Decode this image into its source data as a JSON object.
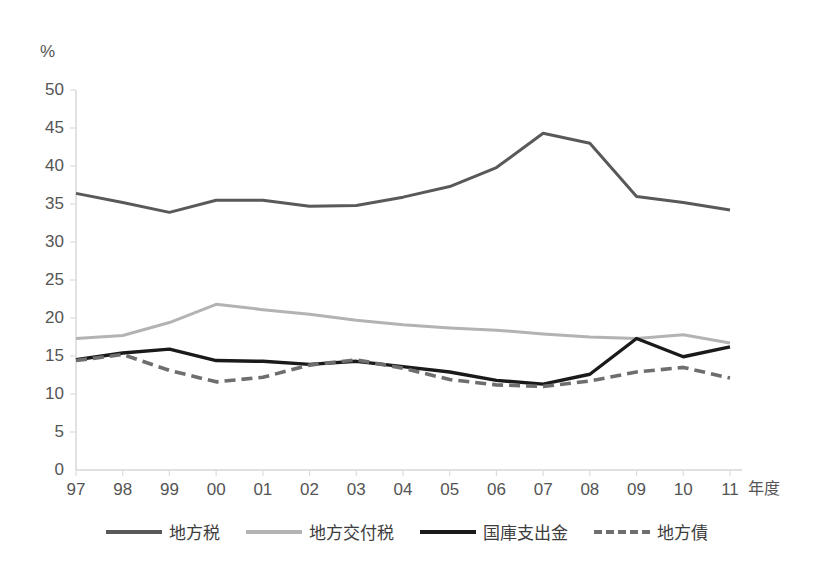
{
  "chart_data": {
    "type": "line",
    "title": "",
    "subtitle": "",
    "xlabel": "年度",
    "ylabel": "%",
    "unit_label": "%",
    "categories": [
      "97",
      "98",
      "99",
      "00",
      "01",
      "02",
      "03",
      "04",
      "05",
      "06",
      "07",
      "08",
      "09",
      "10",
      "11"
    ],
    "xlim": [
      0,
      14
    ],
    "ylim": [
      0,
      50
    ],
    "yticks": [
      0,
      5,
      10,
      15,
      20,
      25,
      30,
      35,
      40,
      45,
      50
    ],
    "ytick_labels": [
      "0",
      "5",
      "10",
      "15",
      "20",
      "25",
      "30",
      "35",
      "40",
      "45",
      "50"
    ],
    "grid": false,
    "legend_position": "bottom",
    "series": [
      {
        "name": "地方税",
        "color": "#595959",
        "style": "solid",
        "width": 3,
        "values": [
          36.4,
          35.2,
          33.9,
          35.5,
          35.5,
          34.7,
          34.8,
          35.9,
          37.3,
          39.8,
          44.3,
          43.0,
          36.0,
          35.2,
          34.2
        ]
      },
      {
        "name": "地方交付税",
        "color": "#b3b3b3",
        "style": "solid",
        "width": 3,
        "values": [
          17.3,
          17.7,
          19.4,
          21.8,
          21.1,
          20.5,
          19.7,
          19.1,
          18.7,
          18.4,
          17.9,
          17.5,
          17.3,
          17.8,
          16.7
        ]
      },
      {
        "name": "国庫支出金",
        "color": "#1a1a1a",
        "style": "solid",
        "width": 3.4,
        "values": [
          14.5,
          15.4,
          15.9,
          14.4,
          14.3,
          13.9,
          14.3,
          13.6,
          12.9,
          11.8,
          11.3,
          12.6,
          17.3,
          14.9,
          16.2
        ]
      },
      {
        "name": "地方債",
        "color": "#6e6e6e",
        "style": "dashed",
        "width": 3.6,
        "values": [
          14.4,
          15.2,
          13.1,
          11.6,
          12.2,
          13.8,
          14.5,
          13.4,
          11.9,
          11.2,
          11.0,
          11.7,
          12.9,
          13.5,
          12.1
        ]
      }
    ]
  },
  "axes": {
    "y_unit": "%",
    "x_title": "年度"
  },
  "legend": {
    "items": [
      {
        "label": "地方税"
      },
      {
        "label": "地方交付税"
      },
      {
        "label": "国庫支出金"
      },
      {
        "label": "地方債"
      }
    ]
  }
}
